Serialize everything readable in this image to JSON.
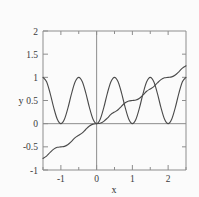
{
  "chart_data": {
    "type": "line",
    "title": "",
    "xlabel": "x",
    "ylabel": "y",
    "xlim": [
      -1.5,
      2.5
    ],
    "ylim": [
      -1,
      2
    ],
    "grid": false,
    "legend": "none",
    "xticks": [
      -1,
      0,
      1,
      2
    ],
    "xtick_labels": [
      "-1",
      "0",
      "1",
      "2"
    ],
    "xminor_ticks": [
      -1.5,
      -0.5,
      0.5,
      1.5,
      2.5
    ],
    "yticks": [
      -1,
      -0.5,
      0,
      0.5,
      1,
      1.5,
      2
    ],
    "ytick_labels": [
      "-1",
      "-0.5",
      "0",
      "0.5",
      "1",
      "1.5",
      "2"
    ],
    "series": [
      {
        "name": "oscillating-curve",
        "description": "sin squared of pi x, touches zero at integers, peaks at 1 at half integers",
        "color": "#4a4a4a",
        "x": [
          -1.5,
          -1.4,
          -1.3,
          -1.2,
          -1.1,
          -1.0,
          -0.9,
          -0.8,
          -0.7,
          -0.6,
          -0.5,
          -0.4,
          -0.3,
          -0.2,
          -0.1,
          0.0,
          0.1,
          0.2,
          0.3,
          0.4,
          0.5,
          0.6,
          0.7,
          0.8,
          0.9,
          1.0,
          1.1,
          1.2,
          1.3,
          1.4,
          1.5,
          1.6,
          1.7,
          1.8,
          1.9,
          2.0,
          2.1,
          2.2,
          2.3,
          2.4,
          2.5
        ],
        "y": [
          1.0,
          0.905,
          0.655,
          0.345,
          0.095,
          0.0,
          0.095,
          0.345,
          0.655,
          0.905,
          1.0,
          0.905,
          0.655,
          0.345,
          0.095,
          0.0,
          0.095,
          0.345,
          0.655,
          0.905,
          1.0,
          0.905,
          0.655,
          0.345,
          0.095,
          0.0,
          0.095,
          0.345,
          0.655,
          0.905,
          1.0,
          0.905,
          0.655,
          0.345,
          0.095,
          0.0,
          0.095,
          0.345,
          0.655,
          0.905,
          1.0
        ]
      },
      {
        "name": "monotonic-s-curve",
        "description": "running integral of sin squared, x over 2 minus sin 2 pi x over 4 pi, rising staircase with plateaus at half integer values",
        "color": "#4a4a4a",
        "x": [
          -1.5,
          -1.4,
          -1.3,
          -1.2,
          -1.1,
          -1.0,
          -0.9,
          -0.8,
          -0.7,
          -0.6,
          -0.5,
          -0.4,
          -0.3,
          -0.2,
          -0.1,
          0.0,
          0.1,
          0.2,
          0.3,
          0.4,
          0.5,
          0.6,
          0.7,
          0.8,
          0.9,
          1.0,
          1.1,
          1.2,
          1.3,
          1.4,
          1.5,
          1.6,
          1.7,
          1.8,
          1.9,
          2.0,
          2.1,
          2.2,
          2.3,
          2.4,
          2.5
        ],
        "y": [
          -0.75,
          -0.7,
          -0.62,
          -0.55,
          -0.51,
          -0.5,
          -0.49,
          -0.45,
          -0.38,
          -0.3,
          -0.25,
          -0.2,
          -0.12,
          -0.05,
          -0.01,
          0.0,
          0.01,
          0.05,
          0.12,
          0.2,
          0.25,
          0.3,
          0.38,
          0.45,
          0.49,
          0.5,
          0.51,
          0.55,
          0.62,
          0.7,
          0.75,
          0.8,
          0.88,
          0.95,
          0.99,
          1.0,
          1.01,
          1.05,
          1.12,
          1.2,
          1.25
        ]
      }
    ]
  },
  "axes": {
    "x_axis_label": "x",
    "y_axis_label": "y"
  }
}
